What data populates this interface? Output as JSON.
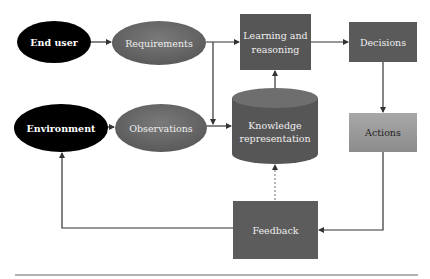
{
  "diagram": {
    "type": "flowchart",
    "nodes": {
      "end_user": {
        "label": "End user",
        "shape": "ellipse",
        "fill": "#000000",
        "text_color": "#ffffff"
      },
      "environment": {
        "label": "Environment",
        "shape": "ellipse",
        "fill": "#000000",
        "text_color": "#ffffff"
      },
      "requirements": {
        "label": "Requirements",
        "shape": "ellipse",
        "fill": "#6a6a6a",
        "text_color": "#eeeeee"
      },
      "observations": {
        "label": "Observations",
        "shape": "ellipse",
        "fill": "#6a6a6a",
        "text_color": "#eeeeee"
      },
      "learning": {
        "label_line1": "Learning and",
        "label_line2": "reasoning",
        "shape": "rect",
        "fill": "#565656",
        "text_color": "#eeeeee"
      },
      "knowledge": {
        "label_line1": "Knowledge",
        "label_line2": "representation",
        "shape": "cylinder",
        "fill": "#5a5a5a",
        "text_color": "#eeeeee"
      },
      "decisions": {
        "label": "Decisions",
        "shape": "rect",
        "fill": "#5a5a5a",
        "text_color": "#eeeeee"
      },
      "actions": {
        "label": "Actions",
        "shape": "rect",
        "fill": "#9a9a9a",
        "text_color": "#222222"
      },
      "feedback": {
        "label": "Feedback",
        "shape": "rect",
        "fill": "#5c5c5c",
        "text_color": "#eeeeee"
      }
    },
    "edges": [
      {
        "from": "End user",
        "to": "Requirements",
        "style": "solid"
      },
      {
        "from": "Environment",
        "to": "Observations",
        "style": "solid"
      },
      {
        "from": "Requirements",
        "to": "Learning and reasoning",
        "style": "solid"
      },
      {
        "from": "Requirements",
        "to": "Knowledge representation",
        "style": "solid"
      },
      {
        "from": "Observations",
        "to": "Knowledge representation",
        "style": "solid"
      },
      {
        "from": "Knowledge representation",
        "to": "Learning and reasoning",
        "style": "solid"
      },
      {
        "from": "Learning and reasoning",
        "to": "Decisions",
        "style": "solid"
      },
      {
        "from": "Decisions",
        "to": "Actions",
        "style": "solid"
      },
      {
        "from": "Actions",
        "to": "Feedback",
        "style": "solid"
      },
      {
        "from": "Feedback",
        "to": "Knowledge representation",
        "style": "dotted"
      },
      {
        "from": "Feedback",
        "to": "Environment",
        "style": "solid"
      }
    ],
    "line_color": "#333333"
  }
}
